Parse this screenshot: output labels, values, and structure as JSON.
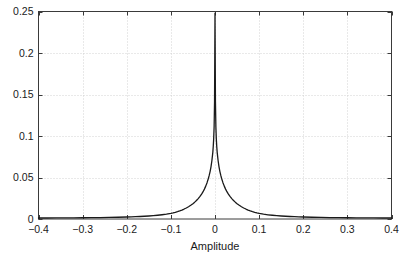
{
  "chart_data": {
    "type": "line",
    "title": "",
    "subtitle": "",
    "xlabel": "Amplitude",
    "ylabel": "",
    "xlim": [
      -0.4,
      0.4
    ],
    "ylim": [
      0,
      0.25
    ],
    "grid": true,
    "legend": null,
    "legend_position": "none",
    "xticks": [
      -0.4,
      -0.3,
      -0.2,
      -0.1,
      0,
      0.1,
      0.2,
      0.3,
      0.4
    ],
    "xtick_labels": [
      "−0.4",
      "−0.3",
      "−0.2",
      "−0.1",
      "0",
      "0.1",
      "0.2",
      "0.3",
      "0.4"
    ],
    "yticks": [
      0,
      0.05,
      0.1,
      0.15,
      0.2,
      0.25
    ],
    "ytick_labels": [
      "0",
      "0.05",
      "0.1",
      "0.15",
      "0.2",
      "0.25"
    ],
    "line_color": "#1a1a1a",
    "line_width": 1.3,
    "grid_color": "#c8c8c8",
    "axis_color": "#3a3a3a",
    "background_color": "#ffffff",
    "series": [
      {
        "name": "amplitude-distribution",
        "x": [
          -0.4,
          -0.38,
          -0.36,
          -0.34,
          -0.32,
          -0.3,
          -0.28,
          -0.26,
          -0.24,
          -0.22,
          -0.2,
          -0.19,
          -0.18,
          -0.17,
          -0.16,
          -0.15,
          -0.14,
          -0.13,
          -0.12,
          -0.11,
          -0.1,
          -0.095,
          -0.09,
          -0.085,
          -0.08,
          -0.075,
          -0.07,
          -0.065,
          -0.06,
          -0.055,
          -0.05,
          -0.046,
          -0.042,
          -0.038,
          -0.034,
          -0.03,
          -0.027,
          -0.024,
          -0.021,
          -0.018,
          -0.015,
          -0.013,
          -0.011,
          -0.009,
          -0.007,
          -0.005,
          -0.004,
          -0.003,
          -0.002,
          -0.001,
          0.0,
          0.001,
          0.002,
          0.003,
          0.004,
          0.005,
          0.007,
          0.009,
          0.011,
          0.013,
          0.015,
          0.018,
          0.021,
          0.024,
          0.027,
          0.03,
          0.034,
          0.038,
          0.042,
          0.046,
          0.05,
          0.055,
          0.06,
          0.065,
          0.07,
          0.075,
          0.08,
          0.085,
          0.09,
          0.095,
          0.1,
          0.11,
          0.12,
          0.13,
          0.14,
          0.15,
          0.16,
          0.17,
          0.18,
          0.19,
          0.2,
          0.22,
          0.24,
          0.26,
          0.28,
          0.3,
          0.32,
          0.34,
          0.36,
          0.38,
          0.4
        ],
        "y": [
          0.0012,
          0.0012,
          0.0013,
          0.0013,
          0.0014,
          0.0015,
          0.0016,
          0.0017,
          0.0019,
          0.0021,
          0.0024,
          0.0026,
          0.0028,
          0.003,
          0.0033,
          0.0036,
          0.004,
          0.0045,
          0.0051,
          0.0058,
          0.0068,
          0.0074,
          0.0081,
          0.0089,
          0.0098,
          0.0108,
          0.012,
          0.0133,
          0.0148,
          0.0165,
          0.0185,
          0.0203,
          0.0223,
          0.0246,
          0.0272,
          0.0302,
          0.0329,
          0.036,
          0.0396,
          0.0438,
          0.0488,
          0.0528,
          0.0575,
          0.0632,
          0.0705,
          0.08,
          0.087,
          0.0965,
          0.111,
          0.142,
          0.248,
          0.142,
          0.111,
          0.0965,
          0.087,
          0.08,
          0.0705,
          0.0632,
          0.0575,
          0.0528,
          0.0488,
          0.0438,
          0.0396,
          0.036,
          0.0329,
          0.0302,
          0.0272,
          0.0246,
          0.0223,
          0.0203,
          0.0185,
          0.0165,
          0.0148,
          0.0133,
          0.012,
          0.0108,
          0.0098,
          0.0089,
          0.0081,
          0.0074,
          0.0068,
          0.0058,
          0.0051,
          0.0045,
          0.004,
          0.0036,
          0.0033,
          0.003,
          0.0028,
          0.0026,
          0.0024,
          0.0021,
          0.0019,
          0.0017,
          0.0016,
          0.0015,
          0.0014,
          0.0013,
          0.0013,
          0.0012,
          0.0012
        ]
      }
    ],
    "annotations": [],
    "peak": {
      "x": 0,
      "y": 0.248
    }
  },
  "axis_title": {
    "x": "Amplitude"
  }
}
